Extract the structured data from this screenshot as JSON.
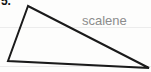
{
  "page": {
    "background_color": "#fdfdfc",
    "width": 151,
    "height": 72,
    "ruled_line_color": "#ececec"
  },
  "problem": {
    "number_label": "5.",
    "number_color": "#121212"
  },
  "figure": {
    "name": "scalene-triangle",
    "stroke_color": "#1a1a1a",
    "fill": "none",
    "stroke_width": 2,
    "vertices": [
      {
        "name": "apex",
        "x": 28,
        "y": 6
      },
      {
        "name": "bottom-left",
        "x": 8,
        "y": 61
      },
      {
        "name": "bottom-right",
        "x": 149,
        "y": 68
      }
    ],
    "points_attr": "28,6 8,61 149,68"
  },
  "label": {
    "text": "scalene",
    "color": "#8c8c8c"
  }
}
